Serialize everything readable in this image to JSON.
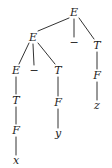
{
  "figure": {
    "kind": "parse-tree",
    "background_color": "#ffffff",
    "ink_color": "#1c1c1c",
    "width": 112,
    "height": 168
  },
  "nodes": [
    {
      "id": "e_root",
      "label": "E",
      "kind": "nonterminal",
      "x": 74,
      "y": 12
    },
    {
      "id": "e_left",
      "label": "E",
      "kind": "nonterminal",
      "x": 33,
      "y": 37
    },
    {
      "id": "minus_root",
      "label": "−",
      "kind": "operator",
      "x": 74,
      "y": 42
    },
    {
      "id": "t_right",
      "label": "T",
      "kind": "nonterminal",
      "x": 97,
      "y": 45
    },
    {
      "id": "e_ll",
      "label": "E",
      "kind": "nonterminal",
      "x": 16,
      "y": 70
    },
    {
      "id": "minus_left",
      "label": "−",
      "kind": "operator",
      "x": 34,
      "y": 70
    },
    {
      "id": "t_mid",
      "label": "T",
      "kind": "nonterminal",
      "x": 58,
      "y": 70
    },
    {
      "id": "f_right",
      "label": "F",
      "kind": "nonterminal",
      "x": 97,
      "y": 75
    },
    {
      "id": "t_ll",
      "label": "T",
      "kind": "nonterminal",
      "x": 16,
      "y": 100
    },
    {
      "id": "f_mid",
      "label": "F",
      "kind": "nonterminal",
      "x": 58,
      "y": 102
    },
    {
      "id": "z_leaf",
      "label": "z",
      "kind": "terminal",
      "x": 97,
      "y": 105
    },
    {
      "id": "f_ll",
      "label": "F",
      "kind": "nonterminal",
      "x": 16,
      "y": 130
    },
    {
      "id": "y_leaf",
      "label": "y",
      "kind": "terminal",
      "x": 58,
      "y": 133
    },
    {
      "id": "x_leaf",
      "label": "x",
      "kind": "terminal",
      "x": 16,
      "y": 160
    }
  ],
  "edges": [
    {
      "from": "e_root",
      "to": "e_left",
      "x1": 69,
      "y1": 18,
      "x2": 38,
      "y2": 31
    },
    {
      "from": "e_root",
      "to": "minus_root",
      "x1": 74,
      "y1": 19,
      "x2": 74,
      "y2": 37
    },
    {
      "from": "e_root",
      "to": "t_right",
      "x1": 79,
      "y1": 18,
      "x2": 94,
      "y2": 39
    },
    {
      "from": "e_left",
      "to": "e_ll",
      "x1": 29,
      "y1": 43,
      "x2": 19,
      "y2": 64
    },
    {
      "from": "e_left",
      "to": "minus_left",
      "x1": 33,
      "y1": 44,
      "x2": 34,
      "y2": 65
    },
    {
      "from": "e_left",
      "to": "t_mid",
      "x1": 38,
      "y1": 43,
      "x2": 55,
      "y2": 64
    },
    {
      "from": "t_right",
      "to": "f_right",
      "x1": 97,
      "y1": 52,
      "x2": 97,
      "y2": 69
    },
    {
      "from": "f_right",
      "to": "z_leaf",
      "x1": 97,
      "y1": 82,
      "x2": 97,
      "y2": 100
    },
    {
      "from": "e_ll",
      "to": "t_ll",
      "x1": 16,
      "y1": 77,
      "x2": 16,
      "y2": 94
    },
    {
      "from": "t_ll",
      "to": "f_ll",
      "x1": 16,
      "y1": 107,
      "x2": 16,
      "y2": 124
    },
    {
      "from": "f_ll",
      "to": "x_leaf",
      "x1": 16,
      "y1": 137,
      "x2": 16,
      "y2": 155
    },
    {
      "from": "t_mid",
      "to": "f_mid",
      "x1": 58,
      "y1": 77,
      "x2": 58,
      "y2": 96
    },
    {
      "from": "f_mid",
      "to": "y_leaf",
      "x1": 58,
      "y1": 109,
      "x2": 58,
      "y2": 128
    }
  ]
}
